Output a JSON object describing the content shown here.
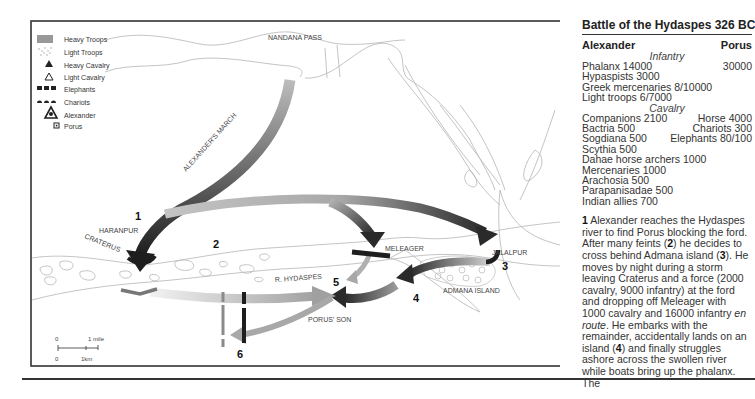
{
  "map": {
    "legend": [
      {
        "icon": "heavy-troops-icon",
        "label": "Heavy Troops"
      },
      {
        "icon": "light-troops-icon",
        "label": "Light Troops"
      },
      {
        "icon": "heavy-cavalry-icon",
        "label": "Heavy Cavalry"
      },
      {
        "icon": "light-cavalry-icon",
        "label": "Light Cavalry"
      },
      {
        "icon": "elephants-icon",
        "label": "Elephants"
      },
      {
        "icon": "chariots-icon",
        "label": "Chariots"
      },
      {
        "icon": "alexander-icon",
        "label": "Alexander"
      },
      {
        "icon": "porus-icon",
        "label": "Porus"
      }
    ],
    "places": {
      "nandana_pass": "NANDANA PASS",
      "haranpur": "HARANPUR",
      "craterus": "CRATERUS",
      "meleager": "MELEAGER",
      "jalalpur": "JALALPUR",
      "river": "R. HYDASPES",
      "admana_island": "ADMANA ISLAND",
      "porus_son": "PORUS' SON",
      "march": "ALEXANDER'S MARCH"
    },
    "markers": [
      "1",
      "2",
      "3",
      "4",
      "5",
      "6"
    ],
    "scale": {
      "top_zero": "0",
      "top_unit": "1 mile",
      "bottom_zero": "0",
      "bottom_unit": "1km"
    }
  },
  "panel": {
    "title": "Battle of the Hydaspes 326 BC",
    "left_header": "Alexander",
    "right_header": "Porus",
    "infantry_label": "Infantry",
    "cavalry_label": "Cavalry",
    "infantry_rows": [
      {
        "left": "Phalanx 14000",
        "right": "30000"
      },
      {
        "left": "Hypaspists 3000",
        "right": ""
      },
      {
        "left": "Greek mercenaries 8/10000",
        "right": ""
      },
      {
        "left": "Light troops 6/7000",
        "right": ""
      }
    ],
    "cavalry_rows": [
      {
        "left": "Companions 2100",
        "right": "Horse 4000"
      },
      {
        "left": "Bactria 500",
        "right": "Chariots 300"
      },
      {
        "left": "Sogdiana 500",
        "right": "Elephants 80/100"
      },
      {
        "left": "Scythia 500",
        "right": ""
      },
      {
        "left": "Dahae horse archers 1000",
        "right": ""
      },
      {
        "left": "Mercenaries 1000",
        "right": ""
      },
      {
        "left": "Arachosia 500",
        "right": ""
      },
      {
        "left": "Parapanisadae 500",
        "right": ""
      },
      {
        "left": "Indian allies 700",
        "right": ""
      }
    ],
    "narrative": {
      "n1": "1",
      "t1": " Alexander reaches the Hydaspes river to find Porus blocking the ford. After many feints (",
      "n2": "2",
      "t2": ") he decides to cross behind Admana island (",
      "n3": "3",
      "t3": "). He moves by night during a storm leaving Craterus and a force (2000 cavalry, 9000 infantry) at the ford and dropping off Meleager with 1000 cavalry and 16000 infantry ",
      "em": "en route",
      "t4": ". He embarks with the remainder, accidentally lands on an island (",
      "n4": "4",
      "t5": ") and finally struggles ashore across the swollen river while boats bring up the phalanx. The"
    }
  }
}
